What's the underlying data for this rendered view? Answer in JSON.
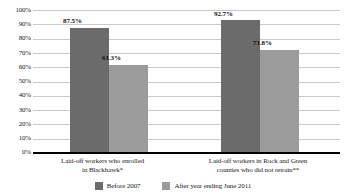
{
  "chart_data": {
    "type": "bar",
    "title": "",
    "subtitle": "",
    "xlabel": "",
    "ylabel": "",
    "ylim": [
      0,
      100
    ],
    "y_tick_labels": [
      "100%",
      "90%",
      "80%",
      "70%",
      "60%",
      "50%",
      "40%",
      "30%",
      "20%",
      "10%",
      "0%"
    ],
    "y_ticks": [
      100,
      90,
      80,
      70,
      60,
      50,
      40,
      30,
      20,
      10,
      0
    ],
    "grid": true,
    "legend_position": "bottom",
    "categories": [
      "Laid-off workers who enrolled in Blackhawk*",
      "Laid-off workers in Rock and Green counties who did not retrain**"
    ],
    "category_lines": [
      [
        "Laid-off workers who enrolled",
        "in Blackhawk*"
      ],
      [
        "Laid-off workers in Rock and Green",
        "counties who did not retrain**"
      ]
    ],
    "series": [
      {
        "name": "Before 2007",
        "color": "#6b6b6b",
        "values": [
          87.5,
          61.3
        ],
        "data_labels": [
          "87.5%",
          "92.7%"
        ]
      },
      {
        "name": "After year ending June 2011",
        "color": "#9b9b9b",
        "values": [
          71.8,
          71.8
        ],
        "data_labels": [
          "61.3%",
          "71.8%"
        ]
      }
    ],
    "bars": [
      {
        "group": 0,
        "series": "Before 2007",
        "value": 87.5,
        "label": "87.5%",
        "color": "#6b6b6b"
      },
      {
        "group": 0,
        "series": "After year ending June 2011",
        "value": 61.3,
        "label": "61.3%",
        "color": "#9b9b9b"
      },
      {
        "group": 1,
        "series": "Before 2007",
        "value": 92.7,
        "label": "92.7%",
        "color": "#6b6b6b"
      },
      {
        "group": 1,
        "series": "After year ending June 2011",
        "value": 71.8,
        "label": "71.8%",
        "color": "#9b9b9b"
      }
    ],
    "legend": [
      {
        "label": "Before 2007",
        "color": "#6b6b6b"
      },
      {
        "label": "After year ending June 2011",
        "color": "#9b9b9b"
      }
    ],
    "colors": {
      "before_2007": "#6b6b6b",
      "after_2011": "#9b9b9b",
      "gridline": "#c9c9c9",
      "axis": "#000000",
      "background": "#ffffff"
    }
  }
}
